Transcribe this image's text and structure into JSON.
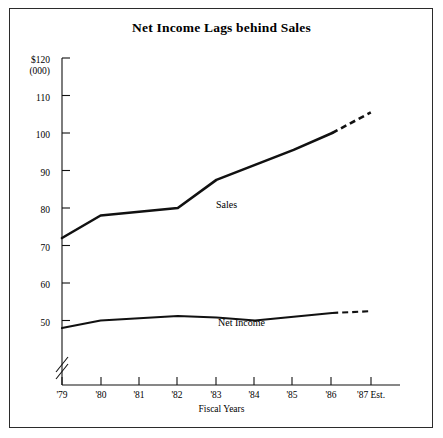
{
  "chart_data": {
    "type": "line",
    "title": "Net Income Lags behind Sales",
    "xlabel": "Fiscal Years",
    "ylabel": "$120\n(000)",
    "y_axis_unit_primary": "$120",
    "y_axis_unit_secondary": "(000)",
    "x": [
      "'79",
      "'80",
      "'81",
      "'82",
      "'83",
      "'84",
      "'85",
      "'86",
      "'87 Est."
    ],
    "categories": [
      "'79",
      "'80",
      "'81",
      "'82",
      "'83",
      "'84",
      "'85",
      "'86",
      "'87 Est."
    ],
    "yticks": [
      50,
      60,
      70,
      80,
      90,
      100,
      110,
      120
    ],
    "ytick_labels": [
      "50",
      "60",
      "70",
      "80",
      "90",
      "100",
      "110",
      "$120"
    ],
    "ylim": [
      46,
      120
    ],
    "grid": false,
    "axis_break": true,
    "legend": "inline-labels",
    "series": [
      {
        "name": "Sales",
        "values": [
          72,
          78,
          79,
          80,
          87.5,
          91.5,
          95.5,
          100,
          105.5
        ],
        "solid_through": "'86",
        "dashed_segment": [
          "'86",
          "'87 Est."
        ],
        "label_x": "'83",
        "label_text": "Sales"
      },
      {
        "name": "Net Income",
        "values": [
          48,
          50,
          50.6,
          51.2,
          50.8,
          50,
          51,
          52,
          52.5
        ],
        "solid_through": "'86",
        "dashed_segment": [
          "'86",
          "'87 Est."
        ],
        "label_x": "'84",
        "label_text": "Net Income"
      }
    ],
    "annotations": [
      {
        "text": "Sales",
        "near_series": "Sales"
      },
      {
        "text": "Net Income",
        "near_series": "Net Income"
      }
    ],
    "line_color": "#111111",
    "frame_color": "#2b2b2b",
    "background": "#ffffff"
  }
}
